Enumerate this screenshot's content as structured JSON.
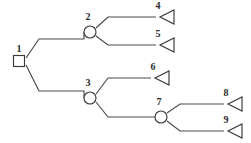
{
  "diagram": {
    "type": "decision-tree",
    "stroke_color": "#4a4a4a",
    "node_fill": "#ffffff",
    "label_color": "#2b2b2b",
    "background": "#ffffff",
    "nodes": [
      {
        "id": "1",
        "label": "1",
        "shape": "square",
        "role": "decision",
        "x": 19,
        "y": 61,
        "label_x": 19,
        "label_y": 52
      },
      {
        "id": "2",
        "label": "2",
        "shape": "circle",
        "role": "chance",
        "x": 90,
        "y": 32,
        "label_x": 88,
        "label_y": 20
      },
      {
        "id": "3",
        "label": "3",
        "shape": "circle",
        "role": "chance",
        "x": 90,
        "y": 98,
        "label_x": 88,
        "label_y": 86
      },
      {
        "id": "4",
        "label": "4",
        "shape": "triangle",
        "role": "terminal",
        "x": 160,
        "y": 17,
        "label_x": 158,
        "label_y": 9
      },
      {
        "id": "5",
        "label": "5",
        "shape": "triangle",
        "role": "terminal",
        "x": 160,
        "y": 45,
        "label_x": 158,
        "label_y": 37
      },
      {
        "id": "6",
        "label": "6",
        "shape": "triangle",
        "role": "terminal",
        "x": 155,
        "y": 78,
        "label_x": 153,
        "label_y": 70
      },
      {
        "id": "7",
        "label": "7",
        "shape": "circle",
        "role": "chance",
        "x": 161,
        "y": 117,
        "label_x": 159,
        "label_y": 105
      },
      {
        "id": "8",
        "label": "8",
        "shape": "triangle",
        "role": "terminal",
        "x": 228,
        "y": 104,
        "label_x": 226,
        "label_y": 96
      },
      {
        "id": "9",
        "label": "9",
        "shape": "triangle",
        "role": "terminal",
        "x": 228,
        "y": 131,
        "label_x": 226,
        "label_y": 123
      }
    ],
    "branches": [
      {
        "id": "b1-2",
        "from": "1",
        "to": "2",
        "path": "M 26 58 L 39 39 L 84 39 L 84 32 L 84 32"
      },
      {
        "id": "b1-3",
        "from": "1",
        "to": "3",
        "path": "M 26 65 L 39 91 L 84 91 L 84 98"
      },
      {
        "id": "b2-4",
        "from": "2",
        "to": "4",
        "path": "M 96 28 L 108 17 L 156 17"
      },
      {
        "id": "b2-5",
        "from": "2",
        "to": "5",
        "path": "M 96 36 L 108 45 L 156 45"
      },
      {
        "id": "b3-6",
        "from": "3",
        "to": "6",
        "path": "M 96 94 L 108 78 L 151 78"
      },
      {
        "id": "b3-7",
        "from": "3",
        "to": "7",
        "path": "M 96 102 L 108 117 L 155 117"
      },
      {
        "id": "b7-8",
        "from": "7",
        "to": "8",
        "path": "M 167 113 L 180 104 L 224 104"
      },
      {
        "id": "b7-9",
        "from": "7",
        "to": "9",
        "path": "M 167 121 L 180 131 L 224 131"
      }
    ],
    "geometry": {
      "square_size": 11,
      "circle_radius": 6,
      "triangle_width": 14,
      "triangle_height": 14
    }
  }
}
